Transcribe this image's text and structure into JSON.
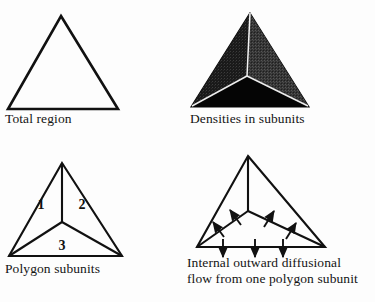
{
  "figure": {
    "background_color": "#fdfdfd",
    "ink_color": "#111111",
    "panels": [
      {
        "id": "total-region",
        "caption": "Total region",
        "shape": "outline-triangle"
      },
      {
        "id": "densities-in-subunits",
        "caption": "Densities in subunits",
        "shape": "filled-triangle-three-subunits",
        "subunit_fills": [
          "#1d1d1d",
          "#3a3a3a",
          "#050505"
        ],
        "divider_color": "#f2f2f2"
      },
      {
        "id": "polygon-subunits",
        "caption": "Polygon subunits",
        "shape": "triangle-divided-three-labeled-subunits",
        "subunit_labels": [
          "1",
          "2",
          "3"
        ]
      },
      {
        "id": "internal-outward-diffusional-flow",
        "caption_line_1": "Internal outward diffusional",
        "caption_line_2": "flow from one polygon subunit",
        "shape": "triangle-with-flow-arrows",
        "arrow_count_left_edge": 2,
        "arrow_count_right_edge": 2,
        "arrow_count_bottom_edge": 3
      }
    ]
  }
}
